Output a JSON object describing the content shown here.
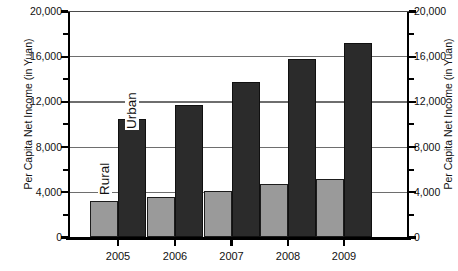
{
  "chart_data": {
    "type": "bar",
    "title": "",
    "xlabel": "",
    "ylabel": "Per Capita Net Income (in Yuan)",
    "ylabel_right": "Per Capita Net Income (in Yuan)",
    "categories": [
      "2005",
      "2006",
      "2007",
      "2008",
      "2009"
    ],
    "ylim": [
      0,
      20000
    ],
    "yticks": [
      0,
      4000,
      8000,
      12000,
      16000,
      20000
    ],
    "ytick_labels": [
      "0",
      "4,000",
      "8,000",
      "12,000",
      "16,000",
      "20,000"
    ],
    "yminor_ticks": [
      2000,
      6000,
      10000,
      14000,
      18000
    ],
    "grid": "horizontal",
    "legend": "in-plot rotated labels",
    "series": [
      {
        "name": "Rural",
        "color": "#9a9a9a",
        "values": [
          3255,
          3587,
          4140,
          4761,
          5153
        ]
      },
      {
        "name": "Urban",
        "color": "#2b2b2b",
        "values": [
          10493,
          11759,
          13786,
          15781,
          17175
        ]
      }
    ]
  },
  "labels": {
    "rural_series_label": "Rural",
    "urban_series_label": "Urban"
  },
  "axis": {
    "left_title": "Per Capita Net Income (in Yuan)",
    "right_title": "Per Capita Net Income (in Yuan)"
  },
  "bottom_artifact": ""
}
